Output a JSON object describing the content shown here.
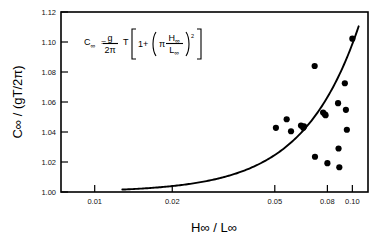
{
  "figure": {
    "name": "wave-celerity-vs-steepness",
    "background_color": "#ffffff",
    "ink_color": "#000000"
  },
  "equation": {
    "lhs": "C",
    "lhs_sub": "∞",
    "equals": "=",
    "frac_num": "g",
    "frac_den": "2π",
    "period": "T",
    "bracket_open": "[",
    "one_plus": "1+",
    "paren_open": "(",
    "pi": "π",
    "inner_num": "H",
    "inner_num_sub": "∞",
    "inner_den": "L",
    "inner_den_sub": "∞",
    "paren_close": ")",
    "exponent": "2",
    "bracket_close": "]",
    "plain": "C∞ = (g/2π) T [1 + (π H∞/L∞)²]"
  },
  "chart_data": {
    "type": "scatter",
    "title": "",
    "subtitle": "",
    "xlabel": "H∞ / L∞",
    "ylabel": "C∞ / (gT/2π)",
    "xscale": "log",
    "yscale": "linear",
    "xlim": [
      0.0074,
      0.115
    ],
    "ylim": [
      1.0,
      1.12
    ],
    "grid": false,
    "legend": "none",
    "xticks": [
      0.01,
      0.02,
      0.05,
      0.08,
      0.1
    ],
    "xtick_labels": [
      "0.01",
      "0.02",
      "0.05",
      "0.08",
      "0.10"
    ],
    "yticks": [
      1.0,
      1.02,
      1.04,
      1.06,
      1.08,
      1.1,
      1.12
    ],
    "ytick_labels": [
      "1.00",
      "1.02",
      "1.04",
      "1.06",
      "1.08",
      "1.10",
      "1.12"
    ],
    "series": [
      {
        "name": "measured data",
        "kind": "scatter",
        "marker": "filled-circle",
        "color": "#000000",
        "points": [
          [
            0.0505,
            1.0428
          ],
          [
            0.0556,
            1.0485
          ],
          [
            0.0578,
            1.0405
          ],
          [
            0.0632,
            1.0443
          ],
          [
            0.0645,
            1.0428
          ],
          [
            0.0649,
            1.0437
          ],
          [
            0.0714,
            1.084
          ],
          [
            0.0716,
            1.0235
          ],
          [
            0.077,
            1.053
          ],
          [
            0.0782,
            1.0518
          ],
          [
            0.0787,
            1.0512
          ],
          [
            0.08,
            1.0192
          ],
          [
            0.088,
            1.0592
          ],
          [
            0.0884,
            1.029
          ],
          [
            0.089,
            1.0165
          ],
          [
            0.0935,
            1.0725
          ],
          [
            0.0944,
            1.0548
          ],
          [
            0.0952,
            1.0415
          ],
          [
            0.1,
            1.1022
          ]
        ]
      },
      {
        "name": "theory: 1 + (π H/L)²",
        "kind": "line",
        "color": "#000000",
        "equation": "y = 1 + (pi*x)^2",
        "x_start": 0.0128,
        "x_end": 0.1058
      }
    ]
  }
}
